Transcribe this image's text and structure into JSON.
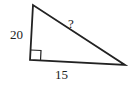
{
  "diagram": {
    "type": "right-triangle",
    "labels": {
      "left_leg": "20",
      "bottom_leg": "15",
      "hypotenuse": "?"
    },
    "right_angle_marker": true,
    "stroke_color": "#222222"
  }
}
